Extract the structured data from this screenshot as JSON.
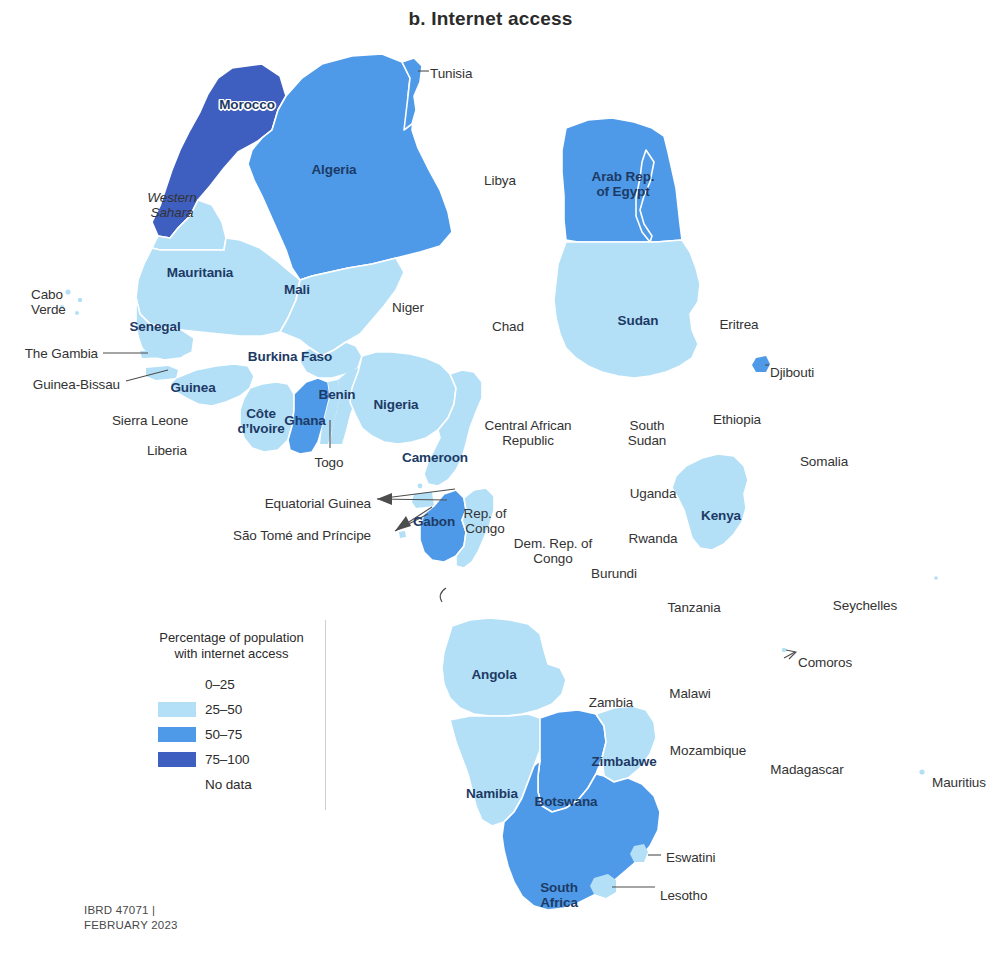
{
  "figure": {
    "title": "b. Internet access",
    "credit": "IBRD 47071 |\nFEBRUARY 2023"
  },
  "legend": {
    "title_line1": "Percentage of population",
    "title_line2": "with internet access",
    "entries": [
      {
        "label": "0–25",
        "color": "#ffffff",
        "has_swatch": false
      },
      {
        "label": "25–50",
        "color": "#b3e0f7",
        "has_swatch": true
      },
      {
        "label": "50–75",
        "color": "#4e9ae8",
        "has_swatch": true
      },
      {
        "label": "75–100",
        "color": "#3f5fc0",
        "has_swatch": true
      },
      {
        "label": "No data",
        "color": "#ffffff",
        "has_swatch": false
      }
    ]
  },
  "colors": {
    "bin_0_25": "#ffffff",
    "bin_25_50": "#b3e0f7",
    "bin_50_75": "#4e9ae8",
    "bin_75_100": "#3f5fc0",
    "no_data": "#ffffff",
    "border": "#ffffff",
    "label_on_map": "#1d3a66",
    "label_off_map": "#333333"
  },
  "chart_data": {
    "type": "map",
    "subtype": "choropleth",
    "title": "b. Internet access",
    "value_label": "Percentage of population with internet access",
    "bins": [
      "0–25",
      "25–50",
      "50–75",
      "75–100",
      "No data"
    ],
    "region": "Africa",
    "legend_position": "lower-left",
    "grid": false,
    "countries": [
      {
        "name": "Morocco",
        "bin": "75–100"
      },
      {
        "name": "Tunisia",
        "bin": "50–75"
      },
      {
        "name": "Algeria",
        "bin": "50–75"
      },
      {
        "name": "Libya",
        "bin": "No data"
      },
      {
        "name": "Arab Rep. of Egypt",
        "bin": "50–75"
      },
      {
        "name": "Western Sahara",
        "bin": "25–50"
      },
      {
        "name": "Mauritania",
        "bin": "25–50"
      },
      {
        "name": "Mali",
        "bin": "25–50"
      },
      {
        "name": "Niger",
        "bin": "No data"
      },
      {
        "name": "Chad",
        "bin": "No data"
      },
      {
        "name": "Sudan",
        "bin": "25–50"
      },
      {
        "name": "Eritrea",
        "bin": "No data"
      },
      {
        "name": "Djibouti",
        "bin": "50–75"
      },
      {
        "name": "Ethiopia",
        "bin": "No data"
      },
      {
        "name": "Somalia",
        "bin": "No data"
      },
      {
        "name": "Cabo Verde",
        "bin": "25–50"
      },
      {
        "name": "Senegal",
        "bin": "25–50"
      },
      {
        "name": "The Gambia",
        "bin": "25–50"
      },
      {
        "name": "Guinea-Bissau",
        "bin": "25–50"
      },
      {
        "name": "Guinea",
        "bin": "25–50"
      },
      {
        "name": "Sierra Leone",
        "bin": "No data"
      },
      {
        "name": "Liberia",
        "bin": "No data"
      },
      {
        "name": "Côte d’Ivoire",
        "bin": "25–50"
      },
      {
        "name": "Burkina Faso",
        "bin": "25–50"
      },
      {
        "name": "Ghana",
        "bin": "50–75"
      },
      {
        "name": "Togo",
        "bin": "25–50"
      },
      {
        "name": "Benin",
        "bin": "25–50"
      },
      {
        "name": "Nigeria",
        "bin": "25–50"
      },
      {
        "name": "Cameroon",
        "bin": "25–50"
      },
      {
        "name": "Central African Republic",
        "bin": "No data"
      },
      {
        "name": "Equatorial Guinea",
        "bin": "25–50"
      },
      {
        "name": "São Tomé and Príncipe",
        "bin": "25–50"
      },
      {
        "name": "Gabon",
        "bin": "50–75"
      },
      {
        "name": "Rep. of Congo",
        "bin": "25–50"
      },
      {
        "name": "Dem. Rep. of Congo",
        "bin": "No data"
      },
      {
        "name": "South Sudan",
        "bin": "No data"
      },
      {
        "name": "Uganda",
        "bin": "No data"
      },
      {
        "name": "Kenya",
        "bin": "25–50"
      },
      {
        "name": "Rwanda",
        "bin": "No data"
      },
      {
        "name": "Burundi",
        "bin": "No data"
      },
      {
        "name": "Tanzania",
        "bin": "No data"
      },
      {
        "name": "Angola",
        "bin": "25–50"
      },
      {
        "name": "Zambia",
        "bin": "No data"
      },
      {
        "name": "Malawi",
        "bin": "No data"
      },
      {
        "name": "Mozambique",
        "bin": "No data"
      },
      {
        "name": "Zimbabwe",
        "bin": "25–50"
      },
      {
        "name": "Botswana",
        "bin": "50–75"
      },
      {
        "name": "Namibia",
        "bin": "25–50"
      },
      {
        "name": "South Africa",
        "bin": "50–75"
      },
      {
        "name": "Eswatini",
        "bin": "25–50"
      },
      {
        "name": "Lesotho",
        "bin": "25–50"
      },
      {
        "name": "Madagascar",
        "bin": "No data"
      },
      {
        "name": "Comoros",
        "bin": "No data"
      },
      {
        "name": "Seychelles",
        "bin": "No data"
      },
      {
        "name": "Mauritius",
        "bin": "25–50"
      }
    ]
  },
  "map_labels": [
    {
      "id": "morocco",
      "text": "Morocco",
      "x": 247,
      "y": 97,
      "style": "knockout",
      "align": "center"
    },
    {
      "id": "tunisia",
      "text": "Tunisia",
      "x": 430,
      "y": 66,
      "style": "outside",
      "align": "left"
    },
    {
      "id": "algeria",
      "text": "Algeria",
      "x": 334,
      "y": 162,
      "style": "dark",
      "align": "center"
    },
    {
      "id": "libya",
      "text": "Libya",
      "x": 500,
      "y": 173,
      "style": "nodata",
      "align": "center"
    },
    {
      "id": "egypt",
      "text": "Arab Rep.\nof Egypt",
      "x": 623,
      "y": 169,
      "style": "dark",
      "align": "center"
    },
    {
      "id": "western-sahara",
      "text": "Western\nSahara",
      "x": 172,
      "y": 190,
      "style": "italic",
      "align": "center"
    },
    {
      "id": "mauritania",
      "text": "Mauritania",
      "x": 200,
      "y": 265,
      "style": "dark",
      "align": "center"
    },
    {
      "id": "mali",
      "text": "Mali",
      "x": 297,
      "y": 282,
      "style": "dark",
      "align": "center"
    },
    {
      "id": "niger",
      "text": "Niger",
      "x": 408,
      "y": 300,
      "style": "nodata",
      "align": "center"
    },
    {
      "id": "chad",
      "text": "Chad",
      "x": 508,
      "y": 319,
      "style": "nodata",
      "align": "center"
    },
    {
      "id": "sudan",
      "text": "Sudan",
      "x": 638,
      "y": 313,
      "style": "dark",
      "align": "center"
    },
    {
      "id": "eritrea",
      "text": "Eritrea",
      "x": 739,
      "y": 317,
      "style": "nodata",
      "align": "center"
    },
    {
      "id": "djibouti",
      "text": "Djibouti",
      "x": 770,
      "y": 365,
      "style": "nodata",
      "align": "left"
    },
    {
      "id": "ethiopia",
      "text": "Ethiopia",
      "x": 737,
      "y": 412,
      "style": "nodata",
      "align": "center"
    },
    {
      "id": "somalia",
      "text": "Somalia",
      "x": 824,
      "y": 454,
      "style": "nodata",
      "align": "center"
    },
    {
      "id": "cabo-verde",
      "text": "Cabo\nVerde",
      "x": 31,
      "y": 287,
      "style": "nodata",
      "align": "left"
    },
    {
      "id": "senegal",
      "text": "Senegal",
      "x": 155,
      "y": 319,
      "style": "dark",
      "align": "center"
    },
    {
      "id": "the-gambia",
      "text": "The Gambia",
      "x": 98,
      "y": 346,
      "style": "nodata",
      "align": "right"
    },
    {
      "id": "guinea-bissau",
      "text": "Guinea-Bissau",
      "x": 120,
      "y": 377,
      "style": "nodata",
      "align": "right"
    },
    {
      "id": "guinea",
      "text": "Guinea",
      "x": 193,
      "y": 380,
      "style": "dark",
      "align": "center"
    },
    {
      "id": "sierra-leone",
      "text": "Sierra Leone",
      "x": 150,
      "y": 413,
      "style": "nodata",
      "align": "center"
    },
    {
      "id": "liberia",
      "text": "Liberia",
      "x": 167,
      "y": 443,
      "style": "nodata",
      "align": "center"
    },
    {
      "id": "cote-divoire",
      "text": "Côte\nd’Ivoire",
      "x": 261,
      "y": 406,
      "style": "dark",
      "align": "center"
    },
    {
      "id": "burkina-faso",
      "text": "Burkina Faso",
      "x": 290,
      "y": 349,
      "style": "dark",
      "align": "center"
    },
    {
      "id": "ghana",
      "text": "Ghana",
      "x": 305,
      "y": 413,
      "style": "dark",
      "align": "center"
    },
    {
      "id": "togo",
      "text": "Togo",
      "x": 329,
      "y": 455,
      "style": "nodata",
      "align": "center"
    },
    {
      "id": "benin",
      "text": "Benin",
      "x": 337,
      "y": 387,
      "style": "dark",
      "align": "center"
    },
    {
      "id": "nigeria",
      "text": "Nigeria",
      "x": 396,
      "y": 397,
      "style": "dark",
      "align": "center"
    },
    {
      "id": "cameroon",
      "text": "Cameroon",
      "x": 435,
      "y": 450,
      "style": "dark",
      "align": "center"
    },
    {
      "id": "car",
      "text": "Central African\nRepublic",
      "x": 528,
      "y": 418,
      "style": "nodata",
      "align": "center"
    },
    {
      "id": "equatorial-guinea",
      "text": "Equatorial Guinea",
      "x": 371,
      "y": 496,
      "style": "nodata",
      "align": "right"
    },
    {
      "id": "sao-tome",
      "text": "São Tomé and Príncipe",
      "x": 371,
      "y": 528,
      "style": "nodata",
      "align": "right"
    },
    {
      "id": "gabon",
      "text": "Gabon",
      "x": 434,
      "y": 514,
      "style": "dark",
      "align": "center"
    },
    {
      "id": "rep-congo",
      "text": "Rep. of\nCongo",
      "x": 485,
      "y": 506,
      "style": "nodata",
      "align": "center"
    },
    {
      "id": "drc",
      "text": "Dem. Rep. of\nCongo",
      "x": 553,
      "y": 536,
      "style": "nodata",
      "align": "center"
    },
    {
      "id": "south-sudan",
      "text": "South\nSudan",
      "x": 647,
      "y": 418,
      "style": "nodata",
      "align": "center"
    },
    {
      "id": "uganda",
      "text": "Uganda",
      "x": 653,
      "y": 486,
      "style": "nodata",
      "align": "center"
    },
    {
      "id": "kenya",
      "text": "Kenya",
      "x": 721,
      "y": 508,
      "style": "dark",
      "align": "center"
    },
    {
      "id": "rwanda",
      "text": "Rwanda",
      "x": 653,
      "y": 531,
      "style": "nodata",
      "align": "center"
    },
    {
      "id": "burundi",
      "text": "Burundi",
      "x": 614,
      "y": 566,
      "style": "nodata",
      "align": "center"
    },
    {
      "id": "tanzania",
      "text": "Tanzania",
      "x": 694,
      "y": 600,
      "style": "nodata",
      "align": "center"
    },
    {
      "id": "seychelles",
      "text": "Seychelles",
      "x": 865,
      "y": 598,
      "style": "nodata",
      "align": "center"
    },
    {
      "id": "comoros",
      "text": "Comoros",
      "x": 798,
      "y": 655,
      "style": "nodata",
      "align": "left"
    },
    {
      "id": "angola",
      "text": "Angola",
      "x": 494,
      "y": 667,
      "style": "dark",
      "align": "center"
    },
    {
      "id": "zambia",
      "text": "Zambia",
      "x": 611,
      "y": 695,
      "style": "nodata",
      "align": "center"
    },
    {
      "id": "malawi",
      "text": "Malawi",
      "x": 690,
      "y": 686,
      "style": "nodata",
      "align": "center"
    },
    {
      "id": "mozambique",
      "text": "Mozambique",
      "x": 708,
      "y": 743,
      "style": "nodata",
      "align": "center"
    },
    {
      "id": "zimbabwe",
      "text": "Zimbabwe",
      "x": 624,
      "y": 754,
      "style": "dark",
      "align": "center"
    },
    {
      "id": "madagascar",
      "text": "Madagascar",
      "x": 807,
      "y": 762,
      "style": "nodata",
      "align": "center"
    },
    {
      "id": "mauritius",
      "text": "Mauritius",
      "x": 932,
      "y": 775,
      "style": "nodata",
      "align": "left"
    },
    {
      "id": "namibia",
      "text": "Namibia",
      "x": 492,
      "y": 786,
      "style": "dark",
      "align": "center"
    },
    {
      "id": "botswana",
      "text": "Botswana",
      "x": 566,
      "y": 794,
      "style": "dark",
      "align": "center"
    },
    {
      "id": "eswatini",
      "text": "Eswatini",
      "x": 666,
      "y": 850,
      "style": "nodata",
      "align": "left"
    },
    {
      "id": "lesotho",
      "text": "Lesotho",
      "x": 660,
      "y": 888,
      "style": "nodata",
      "align": "left"
    },
    {
      "id": "south-africa",
      "text": "South\nAfrica",
      "x": 559,
      "y": 880,
      "style": "dark",
      "align": "center"
    }
  ]
}
